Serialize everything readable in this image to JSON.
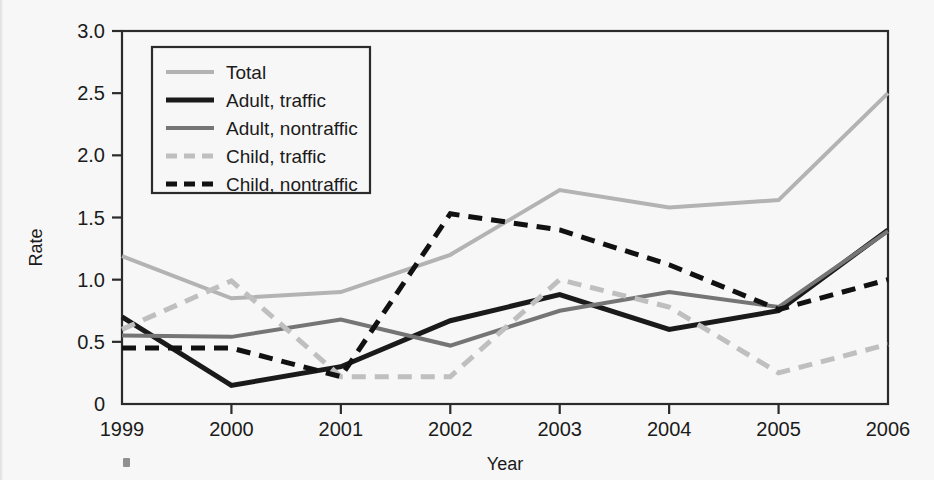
{
  "chart_data": {
    "type": "line",
    "title": "",
    "xlabel": "Year",
    "ylabel": "Rate",
    "categories": [
      "1999",
      "2000",
      "2001",
      "2002",
      "2003",
      "2004",
      "2005",
      "2006"
    ],
    "x": [
      1999,
      2000,
      2001,
      2002,
      2003,
      2004,
      2005,
      2006
    ],
    "xlim": [
      1999,
      2006
    ],
    "ylim": [
      0,
      3.0
    ],
    "yticks": [
      "0",
      "0.5",
      "1.0",
      "1.5",
      "2.0",
      "2.5",
      "3.0"
    ],
    "ytick_values": [
      0,
      0.5,
      1.0,
      1.5,
      2.0,
      2.5,
      3.0
    ],
    "grid": false,
    "legend_position": "top-left inside plot",
    "series": [
      {
        "name": "Total",
        "color": "#b3b3b3",
        "style": "solid",
        "width": 4,
        "values": [
          1.19,
          0.85,
          0.9,
          1.2,
          1.72,
          1.58,
          1.64,
          2.5
        ]
      },
      {
        "name": "Adult, traffic",
        "color": "#1a1a1a",
        "style": "solid",
        "width": 5,
        "values": [
          0.7,
          0.15,
          0.3,
          0.67,
          0.88,
          0.6,
          0.75,
          1.4
        ]
      },
      {
        "name": "Adult, nontraffic",
        "color": "#757575",
        "style": "solid",
        "width": 4,
        "values": [
          0.55,
          0.54,
          0.68,
          0.47,
          0.75,
          0.9,
          0.78,
          1.39
        ]
      },
      {
        "name": "Child, traffic",
        "color": "#bfbfbf",
        "style": "dashed",
        "width": 5,
        "values": [
          0.6,
          0.99,
          0.22,
          0.22,
          1.0,
          0.78,
          0.25,
          0.48
        ]
      },
      {
        "name": "Child, nontraffic",
        "color": "#111111",
        "style": "dashed",
        "width": 5,
        "values": [
          0.45,
          0.45,
          0.22,
          1.53,
          1.4,
          1.12,
          0.76,
          1.0
        ]
      }
    ]
  },
  "axes": {
    "y_title": "Rate",
    "x_title": "Year"
  },
  "legend": {
    "items": [
      {
        "label": "Total"
      },
      {
        "label": "Adult, traffic"
      },
      {
        "label": "Adult, nontraffic"
      },
      {
        "label": "Child, traffic"
      },
      {
        "label": "Child, nontraffic"
      }
    ]
  }
}
